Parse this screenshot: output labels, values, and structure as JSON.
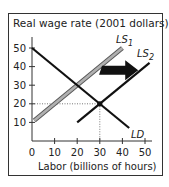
{
  "chart_data": {
    "type": "line",
    "title": "Real wage rate (2001 dollars)",
    "xlabel": "Labor (billions of hours)",
    "ylabel": "Real wage rate (2001 dollars)",
    "xlim": [
      0,
      50
    ],
    "ylim": [
      0,
      50
    ],
    "x_ticks": [
      0,
      10,
      20,
      30,
      40,
      50
    ],
    "y_ticks": [
      10,
      20,
      30,
      40,
      50
    ],
    "x_tick_labels": [
      "0",
      "10",
      "20",
      "30",
      "40",
      "50"
    ],
    "y_tick_labels": [
      "10",
      "20",
      "30",
      "40",
      "50"
    ],
    "grid": false,
    "series": [
      {
        "name": "LS1",
        "label_main": "LS",
        "label_sub": "1",
        "color": "#9a9a9a",
        "style": "thick-gray",
        "points": [
          [
            1,
            11
          ],
          [
            40,
            50
          ]
        ]
      },
      {
        "name": "LS2",
        "label_main": "LS",
        "label_sub": "2",
        "color": "#111111",
        "style": "solid",
        "points": [
          [
            20,
            10
          ],
          [
            52,
            42
          ]
        ]
      },
      {
        "name": "LD",
        "label_main": "LD",
        "label_sub": "",
        "color": "#111111",
        "style": "solid",
        "points": [
          [
            0,
            50
          ],
          [
            43,
            7
          ]
        ]
      }
    ],
    "equilibrium": {
      "x": 30,
      "y": 20
    },
    "annotations": [
      {
        "type": "arrow",
        "description": "shift right of labor supply from LS1 to LS2",
        "from": [
          31,
          38
        ],
        "to": [
          47,
          38
        ],
        "color": "#111111"
      }
    ]
  }
}
